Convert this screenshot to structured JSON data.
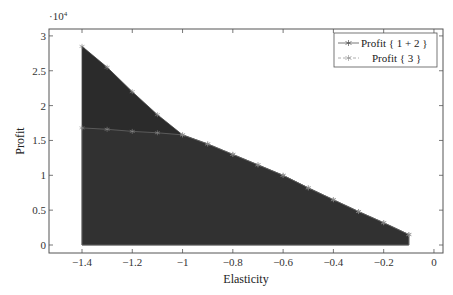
{
  "chart_data": {
    "type": "area",
    "title": "",
    "xlabel": "Elasticity",
    "ylabel": "Profit",
    "y_multiplier_label": "·10",
    "y_multiplier_exp": "4",
    "xlim": [
      -1.45,
      0.03
    ],
    "ylim": [
      -0.12,
      3.1
    ],
    "x_ticks": [
      -1.4,
      -1.2,
      -1.0,
      -0.8,
      -0.6,
      -0.4,
      -0.2,
      0
    ],
    "x_tick_labels": [
      "−1.4",
      "−1.2",
      "−1",
      "−0.8",
      "−0.6",
      "−0.4",
      "−0.2",
      "0"
    ],
    "y_ticks": [
      0,
      0.5,
      1,
      1.5,
      2,
      2.5,
      3
    ],
    "y_tick_labels": [
      "0",
      "0.5",
      "1",
      "1.5",
      "2",
      "2.5",
      "3"
    ],
    "grid": false,
    "legend_position": "upper right",
    "series": [
      {
        "name": "Profit { 1 + 2 }",
        "style": "solid",
        "marker": "star",
        "fill": "#2b2b2b",
        "x": [
          -1.4,
          -1.3,
          -1.2,
          -1.1,
          -1.0,
          -0.9,
          -0.8,
          -0.7,
          -0.6,
          -0.5,
          -0.4,
          -0.3,
          -0.2,
          -0.1
        ],
        "values": [
          2.85,
          2.55,
          2.2,
          1.87,
          1.58,
          1.45,
          1.3,
          1.15,
          1.0,
          0.82,
          0.65,
          0.48,
          0.32,
          0.15
        ]
      },
      {
        "name": "Profit { 3 }",
        "style": "dashed",
        "marker": "star",
        "fill": "#333333",
        "x": [
          -1.4,
          -1.3,
          -1.2,
          -1.1,
          -1.0,
          -0.9,
          -0.8,
          -0.7,
          -0.6,
          -0.5,
          -0.4,
          -0.3,
          -0.2,
          -0.1
        ],
        "values": [
          1.68,
          1.66,
          1.63,
          1.61,
          1.58,
          1.45,
          1.3,
          1.15,
          1.0,
          0.82,
          0.65,
          0.48,
          0.32,
          0.15
        ]
      }
    ]
  },
  "legend": {
    "items": [
      {
        "label": "Profit { 1 + 2 }"
      },
      {
        "label": "Profit { 3 }"
      }
    ]
  }
}
